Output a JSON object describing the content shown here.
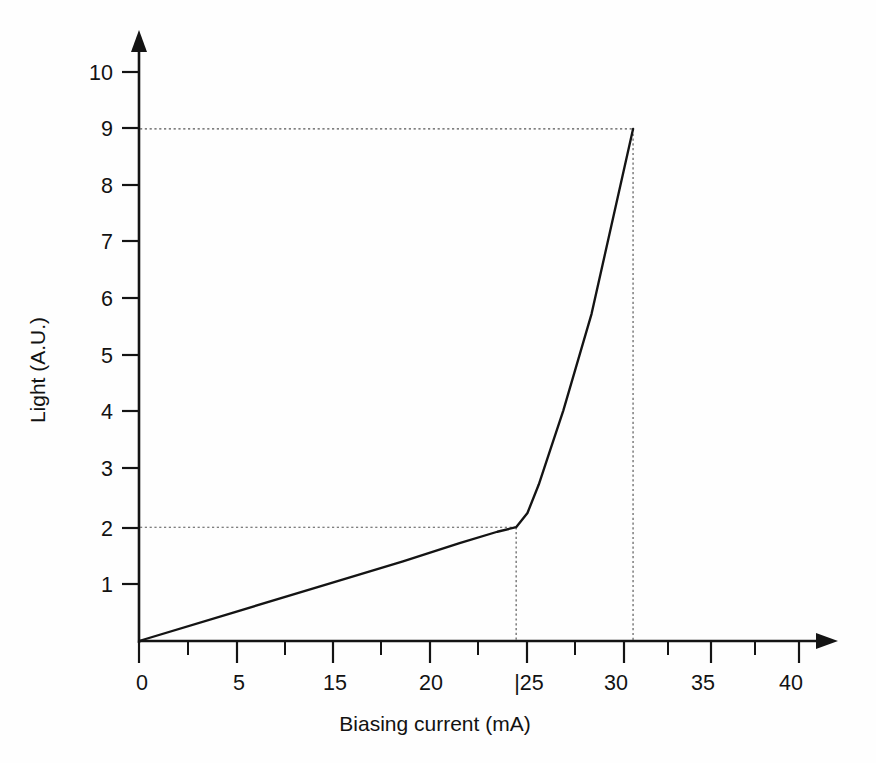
{
  "figure": {
    "background_color": "#fefefe",
    "line_color": "#141414",
    "guide_color": "#555555"
  },
  "chart_data": {
    "type": "line",
    "title": "",
    "subtitle": "",
    "xlabel": "Biasing current (mA)",
    "ylabel": "Light (A.U.)",
    "xlim": [
      0,
      42.5
    ],
    "ylim": [
      0,
      10.6
    ],
    "grid": false,
    "legend": null,
    "x_tick_labels": [
      "0",
      "5",
      "15",
      "20",
      "|25",
      "30",
      "35",
      "40"
    ],
    "x_tick_values": [
      0,
      5,
      10,
      15,
      20,
      25,
      30,
      35
    ],
    "x_minor_tick_values": [
      2.5,
      7.5,
      12.5,
      17.5,
      22.5,
      27.5,
      32.5,
      37.5
    ],
    "y_tick_labels": [
      "1",
      "2",
      "3",
      "4",
      "5",
      "6",
      "7",
      "8",
      "9",
      "10"
    ],
    "y_tick_values": [
      1,
      2,
      3,
      4,
      5,
      6,
      7,
      8,
      9,
      10
    ],
    "series": [
      {
        "name": "LI characteristic",
        "x": [
          0,
          5,
          10,
          14,
          17,
          19,
          20,
          20.6,
          21.2,
          21.8,
          22.5,
          24,
          26.2
        ],
        "y": [
          0,
          0.5,
          1.0,
          1.4,
          1.72,
          1.92,
          2.0,
          2.25,
          2.75,
          3.35,
          4.05,
          5.75,
          9.0
        ]
      }
    ],
    "annotations": [
      {
        "kind": "guide-horizontal",
        "label": "threshold light level",
        "y": 2,
        "x_from": 0,
        "x_to": 20,
        "style": "dotted"
      },
      {
        "kind": "guide-vertical",
        "label": "threshold current",
        "x": 20,
        "y_from": 0,
        "y_to": 2,
        "style": "dotted"
      },
      {
        "kind": "guide-horizontal",
        "label": "maximum light level",
        "y": 9,
        "x_from": 0,
        "x_to": 26.2,
        "style": "dotted"
      },
      {
        "kind": "guide-vertical",
        "label": "maximum current",
        "x": 26.2,
        "y_from": 0,
        "y_to": 9,
        "style": "dotted"
      }
    ]
  },
  "axes": {
    "x_axis_title": "Biasing current (mA)",
    "y_axis_title": "Light (A.U.)",
    "x_ticks": [
      {
        "label": "0",
        "value": 0
      },
      {
        "label": "5",
        "value": 5
      },
      {
        "label": "15",
        "value": 10
      },
      {
        "label": "20",
        "value": 15
      },
      {
        "label": "|25",
        "value": 20
      },
      {
        "label": "30",
        "value": 25
      },
      {
        "label": "35",
        "value": 30
      },
      {
        "label": "40",
        "value": 35
      }
    ],
    "y_ticks": [
      {
        "label": "10",
        "value": 10
      },
      {
        "label": "9",
        "value": 9
      },
      {
        "label": "8",
        "value": 8
      },
      {
        "label": "7",
        "value": 7
      },
      {
        "label": "6",
        "value": 6
      },
      {
        "label": "5",
        "value": 5
      },
      {
        "label": "4",
        "value": 4
      },
      {
        "label": "3",
        "value": 3
      },
      {
        "label": "2",
        "value": 2
      },
      {
        "label": "1",
        "value": 1
      }
    ]
  }
}
